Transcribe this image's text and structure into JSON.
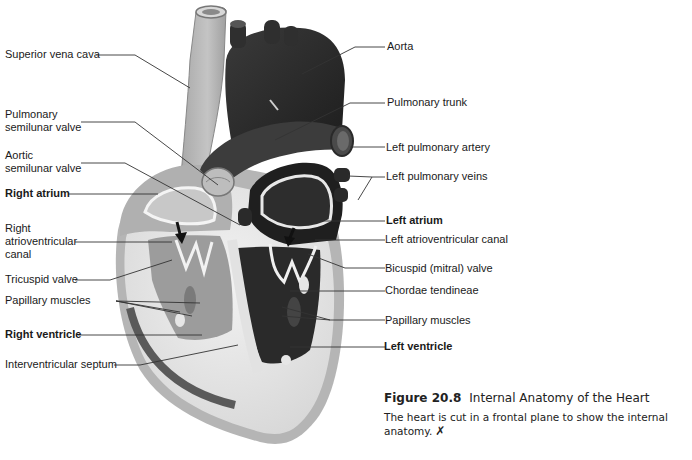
{
  "figure": {
    "number": "Figure 20.8",
    "title": "Internal Anatomy of the Heart",
    "description": "The heart is cut in a frontal plane to show the internal anatomy.",
    "description_line1": "The heart is cut in a frontal plane to show the internal",
    "description_line2": "anatomy.",
    "icon": "tutorial-icon",
    "icon_glyph": "✗"
  },
  "labels_left": [
    {
      "id": "superior-vena-cava",
      "lines": [
        "Superior vena cava"
      ],
      "bold": false
    },
    {
      "id": "pulmonary-semilunar-valve",
      "lines": [
        "Pulmonary",
        "semilunar valve"
      ],
      "bold": false
    },
    {
      "id": "aortic-semilunar-valve",
      "lines": [
        "Aortic",
        "semilunar valve"
      ],
      "bold": false
    },
    {
      "id": "right-atrium",
      "lines": [
        "Right atrium"
      ],
      "bold": true
    },
    {
      "id": "right-av-canal",
      "lines": [
        "Right",
        "atrioventricular",
        "canal"
      ],
      "bold": false
    },
    {
      "id": "tricuspid-valve",
      "lines": [
        "Tricuspid valve"
      ],
      "bold": false
    },
    {
      "id": "papillary-muscles-right",
      "lines": [
        "Papillary muscles"
      ],
      "bold": false
    },
    {
      "id": "right-ventricle",
      "lines": [
        "Right ventricle"
      ],
      "bold": true
    },
    {
      "id": "interventricular-septum",
      "lines": [
        "Interventricular septum"
      ],
      "bold": false
    }
  ],
  "labels_right": [
    {
      "id": "aorta",
      "lines": [
        "Aorta"
      ],
      "bold": false
    },
    {
      "id": "pulmonary-trunk",
      "lines": [
        "Pulmonary trunk"
      ],
      "bold": false
    },
    {
      "id": "left-pulmonary-artery",
      "lines": [
        "Left pulmonary artery"
      ],
      "bold": false
    },
    {
      "id": "left-pulmonary-veins",
      "lines": [
        "Left pulmonary veins"
      ],
      "bold": false
    },
    {
      "id": "left-atrium",
      "lines": [
        "Left atrium"
      ],
      "bold": true
    },
    {
      "id": "left-av-canal",
      "lines": [
        "Left atrioventricular canal"
      ],
      "bold": false
    },
    {
      "id": "bicuspid-valve",
      "lines": [
        "Bicuspid (mitral) valve"
      ],
      "bold": false
    },
    {
      "id": "chordae-tendineae",
      "lines": [
        "Chordae tendineae"
      ],
      "bold": false
    },
    {
      "id": "papillary-muscles-left",
      "lines": [
        "Papillary muscles"
      ],
      "bold": false
    },
    {
      "id": "left-ventricle",
      "lines": [
        "Left ventricle"
      ],
      "bold": true
    }
  ],
  "colors": {
    "background": "#ffffff",
    "deoxygenated_side": "#9a9a9a",
    "oxygenated_side": "#2e2e2e",
    "myocardium": "#e6e6e6",
    "leader_line": "#333333"
  }
}
